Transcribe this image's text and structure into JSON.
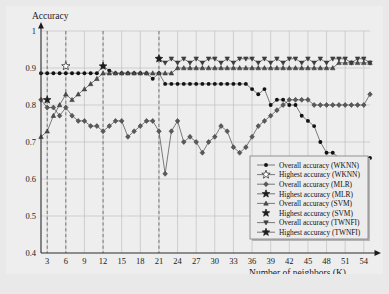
{
  "figure": {
    "background": "#e9e9e9",
    "plot_background": "#eeeeee"
  },
  "axes": {
    "y_title": "Accuracy",
    "x_title": "Number of neighbors (K)",
    "y_ticks": [
      "0.4",
      "0.5",
      "0.6",
      "0.7",
      "0.8",
      "0.9",
      "1"
    ],
    "x_ticks": [
      "3",
      "6",
      "9",
      "12",
      "15",
      "18",
      "21",
      "24",
      "27",
      "30",
      "33",
      "36",
      "39",
      "42",
      "45",
      "48",
      "51",
      "54"
    ]
  },
  "legend": {
    "items": [
      {
        "label": "Overall accuracy (WKNN)",
        "marker": "filled-circle-line",
        "key": "wknn_overall"
      },
      {
        "label": "Highest accuracy (WKNN)",
        "marker": "hollow-star-line",
        "key": "wknn_highest"
      },
      {
        "label": "Overall accuracy (MLR)",
        "marker": "filled-diamond-line",
        "key": "mlr_overall"
      },
      {
        "label": "Highest accuracy (MLR)",
        "marker": "filled-star-line",
        "key": "mlr_highest"
      },
      {
        "label": "Overall accuracy (SVM)",
        "marker": "filled-triangle-line",
        "key": "svm_overall"
      },
      {
        "label": "Highest accuracy (SVM)",
        "marker": "filled-star",
        "key": "svm_highest"
      },
      {
        "label": "Overall accuracy (TWNFI)",
        "marker": "filled-triangle-down-line",
        "key": "twnfi_overall"
      },
      {
        "label": "Highest accuracy (TWNFI)",
        "marker": "filled-star-line",
        "key": "twnfi_highest"
      }
    ]
  },
  "chart_data": {
    "type": "line",
    "title": "",
    "xlabel": "Number of neighbors (K)",
    "ylabel": "Accuracy",
    "xlim": [
      2,
      55
    ],
    "ylim": [
      0.4,
      1.0
    ],
    "grid": true,
    "legend_position": "bottom-right",
    "x": [
      2,
      3,
      4,
      5,
      6,
      7,
      8,
      9,
      10,
      11,
      12,
      13,
      14,
      15,
      16,
      17,
      18,
      19,
      20,
      21,
      22,
      23,
      24,
      25,
      26,
      27,
      28,
      29,
      30,
      31,
      32,
      33,
      34,
      35,
      36,
      37,
      38,
      39,
      40,
      41,
      42,
      43,
      44,
      45,
      46,
      47,
      48,
      49,
      50,
      51,
      52,
      53,
      54,
      55
    ],
    "vertical_markers": [
      3,
      6,
      12,
      21
    ],
    "series": [
      {
        "name": "Overall accuracy (WKNN)",
        "marker": "filled-circle",
        "values": [
          0.886,
          0.886,
          0.886,
          0.886,
          0.886,
          0.886,
          0.886,
          0.886,
          0.886,
          0.886,
          0.905,
          0.893,
          0.886,
          0.886,
          0.886,
          0.886,
          0.886,
          0.886,
          0.871,
          0.886,
          0.857,
          0.857,
          0.857,
          0.857,
          0.857,
          0.857,
          0.857,
          0.857,
          0.857,
          0.857,
          0.857,
          0.857,
          0.857,
          0.857,
          0.843,
          0.829,
          0.843,
          0.8,
          0.814,
          0.814,
          0.8,
          0.8,
          0.771,
          0.757,
          0.743,
          0.7,
          0.671,
          0.671,
          0.657,
          0.657,
          0.657,
          0.657,
          0.657,
          0.657
        ]
      },
      {
        "name": "Highest accuracy (WKNN)",
        "marker": "hollow-star",
        "values": [
          null,
          null,
          null,
          null,
          0.905,
          null,
          null,
          null,
          null,
          null,
          null,
          null,
          null,
          null,
          null,
          null,
          null,
          null,
          null,
          null,
          null,
          null,
          null,
          null,
          null,
          null,
          null,
          null,
          null,
          null,
          null,
          null,
          null,
          null,
          null,
          null,
          null,
          null,
          null,
          null,
          null,
          null,
          null,
          null,
          null,
          null,
          null,
          null,
          null,
          null,
          null,
          null,
          null,
          null
        ]
      },
      {
        "name": "Overall accuracy (MLR)",
        "marker": "filled-diamond",
        "values": [
          0.814,
          0.793,
          0.793,
          0.771,
          0.793,
          0.771,
          0.757,
          0.757,
          0.743,
          0.743,
          0.729,
          0.743,
          0.757,
          0.757,
          0.714,
          0.729,
          0.743,
          0.757,
          0.757,
          0.729,
          0.614,
          0.729,
          0.757,
          0.7,
          0.714,
          0.7,
          0.671,
          0.7,
          0.714,
          0.743,
          0.729,
          0.686,
          0.671,
          0.686,
          0.714,
          0.743,
          0.757,
          0.771,
          0.786,
          0.8,
          0.814,
          0.814,
          0.814,
          0.814,
          0.8,
          0.8,
          0.8,
          0.8,
          0.8,
          0.8,
          0.8,
          0.8,
          0.8,
          0.829
        ]
      },
      {
        "name": "Highest accuracy (MLR)",
        "marker": "filled-star",
        "values": [
          null,
          0.814,
          null,
          null,
          null,
          null,
          null,
          null,
          null,
          null,
          null,
          null,
          null,
          null,
          null,
          null,
          null,
          null,
          null,
          null,
          null,
          null,
          null,
          null,
          null,
          null,
          null,
          null,
          null,
          null,
          null,
          null,
          null,
          null,
          null,
          null,
          null,
          null,
          null,
          null,
          null,
          null,
          null,
          null,
          null,
          null,
          null,
          null,
          null,
          null,
          null,
          null,
          null,
          null
        ]
      },
      {
        "name": "Overall accuracy (SVM)",
        "marker": "filled-triangle",
        "values": [
          0.714,
          0.729,
          0.771,
          0.8,
          0.829,
          0.814,
          0.829,
          0.843,
          0.857,
          0.871,
          0.886,
          0.886,
          0.886,
          0.886,
          0.886,
          0.886,
          0.886,
          0.886,
          0.886,
          0.886,
          0.886,
          0.886,
          0.9,
          0.9,
          0.9,
          0.9,
          0.9,
          0.9,
          0.9,
          0.9,
          0.9,
          0.9,
          0.9,
          0.9,
          0.9,
          0.9,
          0.9,
          0.9,
          0.9,
          0.9,
          0.9,
          0.9,
          0.9,
          0.9,
          0.9,
          0.9,
          0.9,
          0.9,
          0.914,
          0.914,
          0.914,
          0.914,
          0.914,
          0.914
        ]
      },
      {
        "name": "Highest accuracy (SVM)",
        "marker": "filled-star",
        "values": [
          null,
          null,
          null,
          null,
          null,
          null,
          null,
          null,
          null,
          null,
          0.905,
          null,
          null,
          null,
          null,
          null,
          null,
          null,
          null,
          null,
          null,
          null,
          null,
          null,
          null,
          null,
          null,
          null,
          null,
          null,
          null,
          null,
          null,
          null,
          null,
          null,
          null,
          null,
          null,
          null,
          null,
          null,
          null,
          null,
          null,
          null,
          null,
          null,
          null,
          null,
          null,
          null,
          null,
          null
        ]
      },
      {
        "name": "Overall accuracy (TWNFI)",
        "marker": "filled-triangle-down",
        "values": [
          null,
          null,
          null,
          null,
          null,
          null,
          null,
          null,
          null,
          null,
          null,
          null,
          null,
          null,
          null,
          null,
          null,
          null,
          null,
          0.925,
          0.914,
          0.925,
          0.914,
          0.925,
          0.914,
          0.925,
          0.914,
          0.925,
          0.925,
          0.914,
          0.925,
          0.914,
          0.925,
          0.925,
          0.925,
          0.914,
          0.925,
          0.914,
          0.925,
          0.914,
          0.925,
          0.925,
          0.914,
          0.925,
          0.914,
          0.925,
          0.914,
          0.925,
          0.925,
          0.925,
          0.914,
          0.925,
          0.925,
          0.914
        ]
      },
      {
        "name": "Highest accuracy (TWNFI)",
        "marker": "filled-star",
        "values": [
          null,
          null,
          null,
          null,
          null,
          null,
          null,
          null,
          null,
          null,
          null,
          null,
          null,
          null,
          null,
          null,
          null,
          null,
          null,
          0.925,
          null,
          null,
          null,
          null,
          null,
          null,
          null,
          null,
          null,
          null,
          null,
          null,
          null,
          null,
          null,
          null,
          null,
          null,
          null,
          null,
          null,
          null,
          null,
          null,
          null,
          null,
          null,
          null,
          null,
          null,
          null,
          null,
          null,
          null
        ]
      }
    ]
  }
}
